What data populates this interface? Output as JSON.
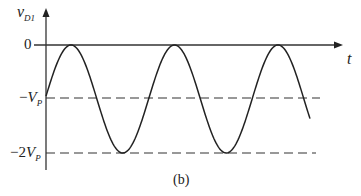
{
  "diagram": {
    "y_axis_label": "v",
    "y_axis_label_sub": "D1",
    "x_axis_label": "t",
    "levels": [
      {
        "label": "0",
        "value": 0
      },
      {
        "label_prefix": "−",
        "label_var": "V",
        "label_sub": "P",
        "value": -1
      },
      {
        "label_prefix": "−2",
        "label_var": "V",
        "label_sub": "P",
        "value": -2
      }
    ],
    "caption": "(b)",
    "waveform": "sinusoid oscillating between 0 and −2V_P, centered at −V_P, ~2.6 periods",
    "colors": {
      "line": "#222222",
      "dashed": "#333333"
    }
  }
}
